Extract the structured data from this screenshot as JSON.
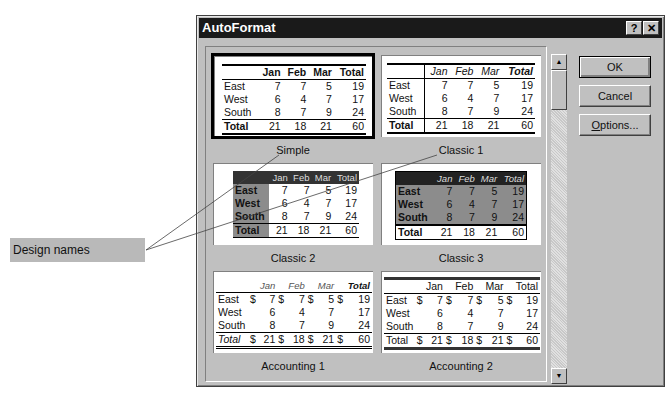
{
  "callout": {
    "label": "Design names"
  },
  "dialog": {
    "title": "AutoFormat",
    "help_label": "?",
    "close_label": "✕",
    "buttons": {
      "ok": "OK",
      "cancel": "Cancel",
      "options_mnemonic": "O",
      "options_rest": "ptions..."
    },
    "scrollbar": {
      "up": "▲",
      "down": "▼"
    }
  },
  "table": {
    "headers": [
      "Jan",
      "Feb",
      "Mar",
      "Total"
    ],
    "rows": [
      {
        "label": "East",
        "values": [
          "7",
          "7",
          "5",
          "19"
        ]
      },
      {
        "label": "West",
        "values": [
          "6",
          "4",
          "7",
          "17"
        ]
      },
      {
        "label": "South",
        "values": [
          "8",
          "7",
          "9",
          "24"
        ]
      }
    ],
    "total": {
      "label": "Total",
      "values": [
        "21",
        "18",
        "21",
        "60"
      ]
    },
    "currency": "$"
  },
  "formats": [
    {
      "name": "Simple",
      "selected": true
    },
    {
      "name": "Classic 1",
      "selected": false
    },
    {
      "name": "Classic 2",
      "selected": false
    },
    {
      "name": "Classic 3",
      "selected": false
    },
    {
      "name": "Accounting 1",
      "selected": false
    },
    {
      "name": "Accounting 2",
      "selected": false
    }
  ]
}
